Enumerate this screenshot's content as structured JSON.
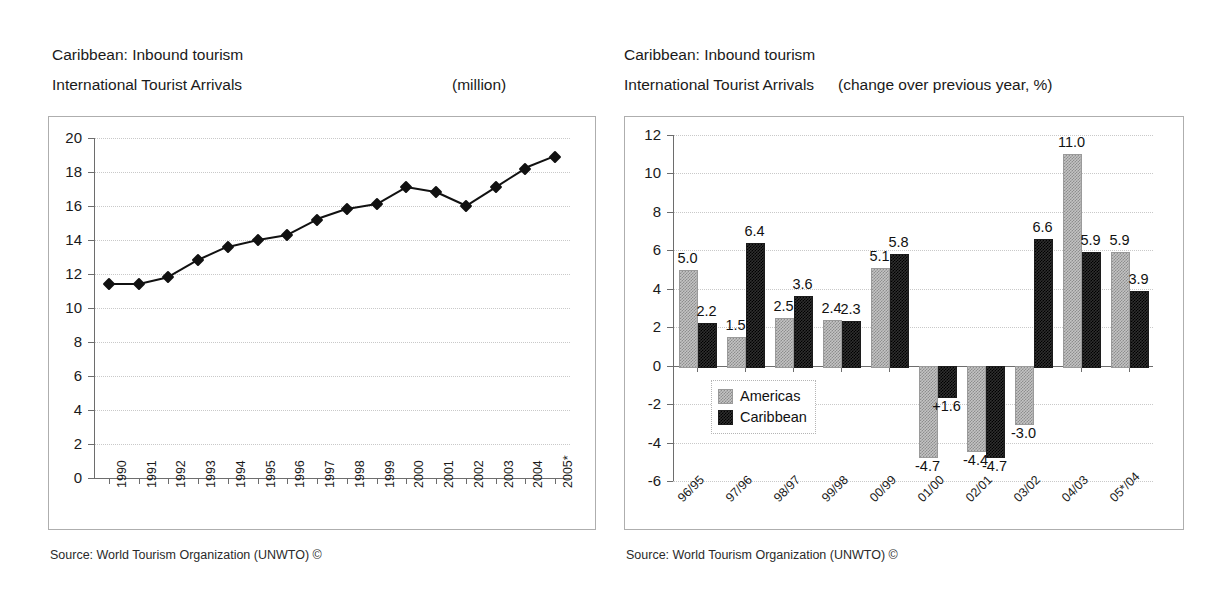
{
  "left": {
    "title_line1": "Caribbean: Inbound tourism",
    "title_line2": "International Tourist Arrivals",
    "unit": "(million)",
    "source": "Source: World Tourism Organization (UNWTO) ©"
  },
  "right": {
    "title_line1": "Caribbean: Inbound tourism",
    "title_line2": "International Tourist Arrivals",
    "unit": "(change over previous year, %)",
    "source": "Source: World Tourism Organization (UNWTO) ©"
  },
  "colors": {
    "americas": "#c3c3c3",
    "caribbean": "#2f2f2f",
    "line": "#111111",
    "grid": "#c9c9c9",
    "axis": "#6d6d6d",
    "frame": "#aeaeae"
  },
  "chart_data": [
    {
      "type": "line",
      "title": "Caribbean: Inbound tourism — International Tourist Arrivals",
      "ylabel": "(million)",
      "xlabel": "",
      "ylim": [
        0,
        20
      ],
      "ytick_step": 2,
      "yticks": [
        "0",
        "2",
        "4",
        "6",
        "8",
        "10",
        "12",
        "14",
        "16",
        "18",
        "20"
      ],
      "grid": true,
      "legend": "none",
      "categories": [
        "1990",
        "1991",
        "1992",
        "1993",
        "1994",
        "1995",
        "1996",
        "1997",
        "1998",
        "1999",
        "2000",
        "2001",
        "2002",
        "2003",
        "2004",
        "2005*"
      ],
      "values": [
        11.4,
        11.4,
        11.8,
        12.8,
        13.6,
        14.0,
        14.3,
        15.2,
        15.8,
        16.1,
        17.1,
        16.8,
        16.0,
        17.1,
        18.2,
        18.9
      ]
    },
    {
      "type": "bar",
      "title": "Caribbean: Inbound tourism — International Tourist Arrivals",
      "ylabel": "(change over previous year, %)",
      "xlabel": "",
      "ylim": [
        -6,
        12
      ],
      "ytick_step": 2,
      "yticks": [
        "-6",
        "-4",
        "-2",
        "0",
        "2",
        "4",
        "6",
        "8",
        "10",
        "12"
      ],
      "grid": true,
      "legend_position": "inside-left",
      "categories": [
        "96/95",
        "97/96",
        "98/97",
        "99/98",
        "00/99",
        "01/00",
        "02/01",
        "03/02",
        "04/03",
        "05*/04"
      ],
      "series": [
        {
          "name": "Americas",
          "color": "#c3c3c3",
          "values": [
            5.0,
            1.5,
            2.5,
            2.4,
            5.1,
            -4.7,
            -4.4,
            -3.0,
            11.0,
            5.9
          ],
          "labels": [
            "5.0",
            "1.5",
            "2.5",
            "2.4",
            "5.1",
            "-4.7",
            "-4.4",
            "-3.0",
            "11.0",
            "5.9"
          ]
        },
        {
          "name": "Caribbean",
          "color": "#2f2f2f",
          "values": [
            2.2,
            6.4,
            3.6,
            2.3,
            5.8,
            -1.6,
            -4.7,
            6.6,
            5.9,
            3.9
          ],
          "labels": [
            "2.2",
            "6.4",
            "3.6",
            "2.3",
            "5.8",
            "+1.6",
            "-4.7",
            "6.6",
            "5.9",
            "3.9"
          ]
        }
      ]
    }
  ]
}
